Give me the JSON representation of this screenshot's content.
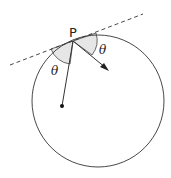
{
  "diagram": {
    "point_label": "P",
    "angle_left_label": "θ",
    "angle_right_label": "θ",
    "colors": {
      "stroke": "#333333",
      "shade": "#e6e6e6"
    }
  }
}
